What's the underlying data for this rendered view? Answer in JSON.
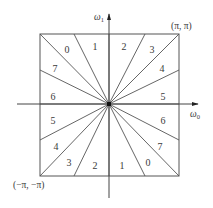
{
  "diagram": {
    "type": "frequency-plane-partition",
    "axes": {
      "horizontal": {
        "label": "ω",
        "subscript": "0"
      },
      "vertical": {
        "label": "ω",
        "subscript": "1"
      }
    },
    "corners": {
      "top_right": "(π, π)",
      "bottom_left": "(−π, −π)"
    },
    "square": {
      "x0": 40,
      "y0": 34,
      "x1": 179,
      "y1": 176
    },
    "center": {
      "x": 109,
      "y": 104
    },
    "ray_endpoints": [
      [
        40,
        34
      ],
      [
        74,
        34
      ],
      [
        109,
        34
      ],
      [
        145,
        34
      ],
      [
        179,
        34
      ],
      [
        179,
        70
      ],
      [
        179,
        104
      ],
      [
        179,
        140
      ],
      [
        179,
        176
      ],
      [
        145,
        176
      ],
      [
        109,
        176
      ],
      [
        74,
        176
      ],
      [
        40,
        176
      ],
      [
        40,
        140
      ],
      [
        40,
        104
      ],
      [
        40,
        70
      ]
    ],
    "regions": [
      {
        "label": "0",
        "x": 67,
        "y": 51
      },
      {
        "label": "1",
        "x": 95,
        "y": 48
      },
      {
        "label": "2",
        "x": 124,
        "y": 48
      },
      {
        "label": "3",
        "x": 152,
        "y": 51
      },
      {
        "label": "7",
        "x": 55,
        "y": 70
      },
      {
        "label": "4",
        "x": 162,
        "y": 70
      },
      {
        "label": "6",
        "x": 53,
        "y": 98
      },
      {
        "label": "5",
        "x": 163,
        "y": 98
      },
      {
        "label": "5",
        "x": 53,
        "y": 122
      },
      {
        "label": "6",
        "x": 163,
        "y": 122
      },
      {
        "label": "4",
        "x": 56,
        "y": 148
      },
      {
        "label": "7",
        "x": 160,
        "y": 148
      },
      {
        "label": "3",
        "x": 69,
        "y": 164
      },
      {
        "label": "2",
        "x": 95,
        "y": 167
      },
      {
        "label": "1",
        "x": 122,
        "y": 167
      },
      {
        "label": "0",
        "x": 148,
        "y": 164
      }
    ],
    "colors": {
      "line": "#555555",
      "text": "#3a3a3a",
      "background": "#ffffff"
    }
  }
}
